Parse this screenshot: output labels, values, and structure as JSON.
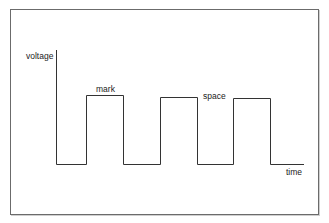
{
  "diagram": {
    "y_axis_label": "voltage",
    "x_axis_label": "time",
    "pulse_labels": {
      "mark": "mark",
      "space": "space"
    },
    "pulses": [
      {
        "x_start": 86,
        "x_end": 123,
        "top": 95
      },
      {
        "x_start": 160,
        "x_end": 197,
        "top": 97
      },
      {
        "x_start": 233,
        "x_end": 270,
        "top": 98
      }
    ],
    "axis": {
      "origin_x": 56,
      "baseline_y": 164,
      "top_y": 50,
      "end_x": 304
    },
    "line_color": "#333333",
    "frame_color": "#6b6b6b"
  }
}
